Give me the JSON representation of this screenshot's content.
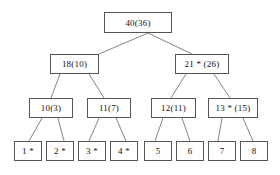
{
  "figure": {
    "background_color": "#ffffff",
    "box_border_color": "#555555",
    "edge_color": "#777777",
    "text_color": "#111111",
    "width": 280,
    "height": 175
  },
  "nodes": [
    {
      "id": "root",
      "label": "40(36)",
      "level": 0,
      "x": 104,
      "y": 12,
      "w": 68,
      "h": 21
    },
    {
      "id": "n18",
      "label": "18(10)",
      "level": 1,
      "x": 50,
      "y": 54,
      "w": 49,
      "h": 20
    },
    {
      "id": "n21",
      "label": "21 * (26)",
      "level": 1,
      "x": 175,
      "y": 54,
      "w": 54,
      "h": 20
    },
    {
      "id": "n10",
      "label": "10(3)",
      "level": 2,
      "x": 29,
      "y": 98,
      "w": 44,
      "h": 20
    },
    {
      "id": "n11",
      "label": "11(7)",
      "level": 2,
      "x": 87,
      "y": 98,
      "w": 44,
      "h": 20
    },
    {
      "id": "n12",
      "label": "12(11)",
      "level": 2,
      "x": 151,
      "y": 98,
      "w": 45,
      "h": 20
    },
    {
      "id": "n13",
      "label": "13 * (15)",
      "level": 2,
      "x": 208,
      "y": 98,
      "w": 50,
      "h": 20
    },
    {
      "id": "leaf1",
      "label": "1 *",
      "level": 3,
      "x": 14,
      "y": 141,
      "w": 28,
      "h": 20
    },
    {
      "id": "leaf2",
      "label": "2 *",
      "level": 3,
      "x": 46,
      "y": 141,
      "w": 28,
      "h": 20
    },
    {
      "id": "leaf3",
      "label": "3 *",
      "level": 3,
      "x": 78,
      "y": 141,
      "w": 28,
      "h": 20
    },
    {
      "id": "leaf4",
      "label": "4 *",
      "level": 3,
      "x": 110,
      "y": 141,
      "w": 28,
      "h": 20
    },
    {
      "id": "leaf5",
      "label": "5",
      "level": 3,
      "x": 144,
      "y": 141,
      "w": 28,
      "h": 20
    },
    {
      "id": "leaf6",
      "label": "6",
      "level": 3,
      "x": 176,
      "y": 141,
      "w": 28,
      "h": 20
    },
    {
      "id": "leaf7",
      "label": "7",
      "level": 3,
      "x": 208,
      "y": 141,
      "w": 28,
      "h": 20
    },
    {
      "id": "leaf8",
      "label": "8",
      "level": 3,
      "x": 240,
      "y": 141,
      "w": 28,
      "h": 20
    }
  ],
  "edges": [
    {
      "id": "root-n18",
      "from": "root",
      "to": "n18",
      "x1": 148,
      "y1": 33,
      "x2": 99,
      "y2": 54
    },
    {
      "id": "root-n21",
      "from": "root",
      "to": "n21",
      "x1": 148,
      "y1": 33,
      "x2": 192,
      "y2": 54
    },
    {
      "id": "n18-n10",
      "from": "n18",
      "to": "n10",
      "x1": 60,
      "y1": 74,
      "x2": 51,
      "y2": 98
    },
    {
      "id": "n18-n11",
      "from": "n18",
      "to": "n11",
      "x1": 89,
      "y1": 74,
      "x2": 104,
      "y2": 98
    },
    {
      "id": "n21-n12",
      "from": "n21",
      "to": "n12",
      "x1": 186,
      "y1": 74,
      "x2": 171,
      "y2": 98
    },
    {
      "id": "n21-n13",
      "from": "n21",
      "to": "n13",
      "x1": 214,
      "y1": 74,
      "x2": 230,
      "y2": 98
    },
    {
      "id": "n10-leaf1",
      "from": "n10",
      "to": "leaf1",
      "x1": 42,
      "y1": 118,
      "x2": 29,
      "y2": 141
    },
    {
      "id": "n10-leaf2",
      "from": "n10",
      "to": "leaf2",
      "x1": 58,
      "y1": 118,
      "x2": 64,
      "y2": 141
    },
    {
      "id": "n11-leaf3",
      "from": "n11",
      "to": "leaf3",
      "x1": 99,
      "y1": 118,
      "x2": 89,
      "y2": 141
    },
    {
      "id": "n11-leaf4",
      "from": "n11",
      "to": "leaf4",
      "x1": 116,
      "y1": 118,
      "x2": 126,
      "y2": 141
    },
    {
      "id": "n12-leaf5",
      "from": "n12",
      "to": "leaf5",
      "x1": 163,
      "y1": 118,
      "x2": 155,
      "y2": 141
    },
    {
      "id": "n12-leaf6",
      "from": "n12",
      "to": "leaf6",
      "x1": 182,
      "y1": 118,
      "x2": 190,
      "y2": 141
    },
    {
      "id": "n13-leaf7",
      "from": "n13",
      "to": "leaf7",
      "x1": 222,
      "y1": 118,
      "x2": 218,
      "y2": 141
    },
    {
      "id": "n13-leaf8",
      "from": "n13",
      "to": "leaf8",
      "x1": 243,
      "y1": 118,
      "x2": 253,
      "y2": 141
    }
  ]
}
